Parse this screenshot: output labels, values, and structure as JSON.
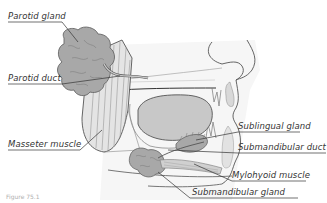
{
  "diagram": {
    "labels": {
      "parotid_gland": "Parotid gland",
      "parotid_duct": "Parotid duct",
      "masseter_muscle": "Masseter muscle",
      "sublingual_gland": "Sublingual gland",
      "submandibular_duct": "Submandibular duct",
      "mylohyoid_muscle": "Mylohyoid muscle",
      "submandibular_gland": "Submandibular gland"
    },
    "caption": "Figure 75.1",
    "colors": {
      "gland_fill": "#a8a8a8",
      "gland_stroke": "#6a6a6a",
      "muscle_fill": "#dcdcdc",
      "tongue_fill": "#c8c8c8",
      "outline": "#555555",
      "leader_line": "#333333",
      "face_shade": "#f0f0f0"
    }
  }
}
